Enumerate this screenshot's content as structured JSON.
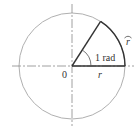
{
  "diagram": {
    "center_label": "0",
    "radius_label": "r",
    "arc_label": "r",
    "arc_label_accent": "⌒",
    "angle_label": "1 rad",
    "colors": {
      "circle": "#aaaaaa",
      "axes": "#888888",
      "radius_lines": "#333333",
      "text": "#333333"
    }
  }
}
